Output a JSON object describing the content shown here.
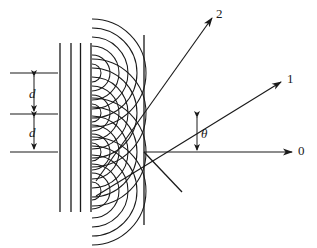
{
  "figure": {
    "type": "optics-diagram",
    "background_color": "#ffffff",
    "stroke_color": "#1a1a1a",
    "width": 317,
    "height": 248
  },
  "labels": {
    "order_2": "2",
    "order_1": "1",
    "order_0": "0",
    "spacing_top": "d",
    "spacing_bottom": "d",
    "angle": "θ"
  },
  "geometry": {
    "grating_plane_x": 92,
    "screen_line_x": 144,
    "vertex": {
      "x": 144,
      "y": 152
    },
    "incident_wavefronts_x": [
      60,
      71,
      80.5,
      91
    ],
    "incident_wavefront_top_y": 43,
    "incident_wavefront_bottom_y": 212,
    "slit_centers_y": [
      73,
      113,
      152,
      191
    ],
    "wavelet_radii": [
      9,
      18,
      27,
      36,
      45,
      54
    ],
    "dimension_ticks_y": [
      73,
      114,
      152
    ],
    "dimension_tick_x_start": 10,
    "dimension_tick_x_end": 58,
    "dimension_arrow_x": 34,
    "rays": [
      {
        "name": "order_2",
        "angle_deg": 31,
        "tip_x": 212,
        "tip_y": 18
      },
      {
        "name": "order_1",
        "angle_deg": 14,
        "tip_x": 281,
        "tip_y": 82
      },
      {
        "name": "order_0",
        "angle_deg": 0,
        "tip_x": 292,
        "tip_y": 152
      }
    ],
    "ray_tail_extension": {
      "x": 182,
      "y": 192
    },
    "angle_marker_x": 197,
    "angle_marker_top_y": 115,
    "angle_marker_bottom_y": 152
  }
}
